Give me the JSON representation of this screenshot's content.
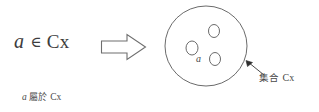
{
  "figure": {
    "background_color": "#ffffff",
    "ink_color": "#3d3d3d",
    "formula": {
      "variable": "a",
      "operator": "∈",
      "set_name": "Cx"
    },
    "caption": {
      "variable": "a",
      "cjk_text": "屬於",
      "set_name": "Cx"
    },
    "arrow": {
      "icon": "block-arrow-right-icon",
      "direction": "right"
    },
    "set_diagram": {
      "set_label": "Cx",
      "members": [
        {
          "id": "member-a",
          "label": "a"
        },
        {
          "id": "member-2",
          "label": ""
        },
        {
          "id": "member-3",
          "label": ""
        }
      ],
      "member_label": "a"
    },
    "annotation": {
      "cjk_text": "集合",
      "set_name": "Cx",
      "pointer_icon": "leader-arrow-icon"
    }
  }
}
